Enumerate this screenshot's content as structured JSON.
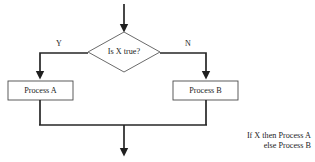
{
  "diagram": {
    "type": "flowchart",
    "background_color": "#ffffff",
    "line_color": "#262626",
    "box_border_color": "#4a4a4a",
    "text_color": "#1c1c1c",
    "decision": {
      "label": "Is X true?",
      "shape": "diamond"
    },
    "branches": {
      "yes_label": "Y",
      "no_label": "N"
    },
    "processes": [
      {
        "label": "Process A",
        "shape": "rectangle",
        "branch": "Y"
      },
      {
        "label": "Process B",
        "shape": "rectangle",
        "branch": "N"
      }
    ],
    "caption": {
      "line1": "If X then Process A",
      "line2": "else Process B"
    },
    "arrows": {
      "entry": "arrow-down-into-decision",
      "to_process_a": "arrow-down-into-process-a",
      "to_process_b": "arrow-down-into-process-b",
      "exit": "arrow-down-exit"
    }
  }
}
